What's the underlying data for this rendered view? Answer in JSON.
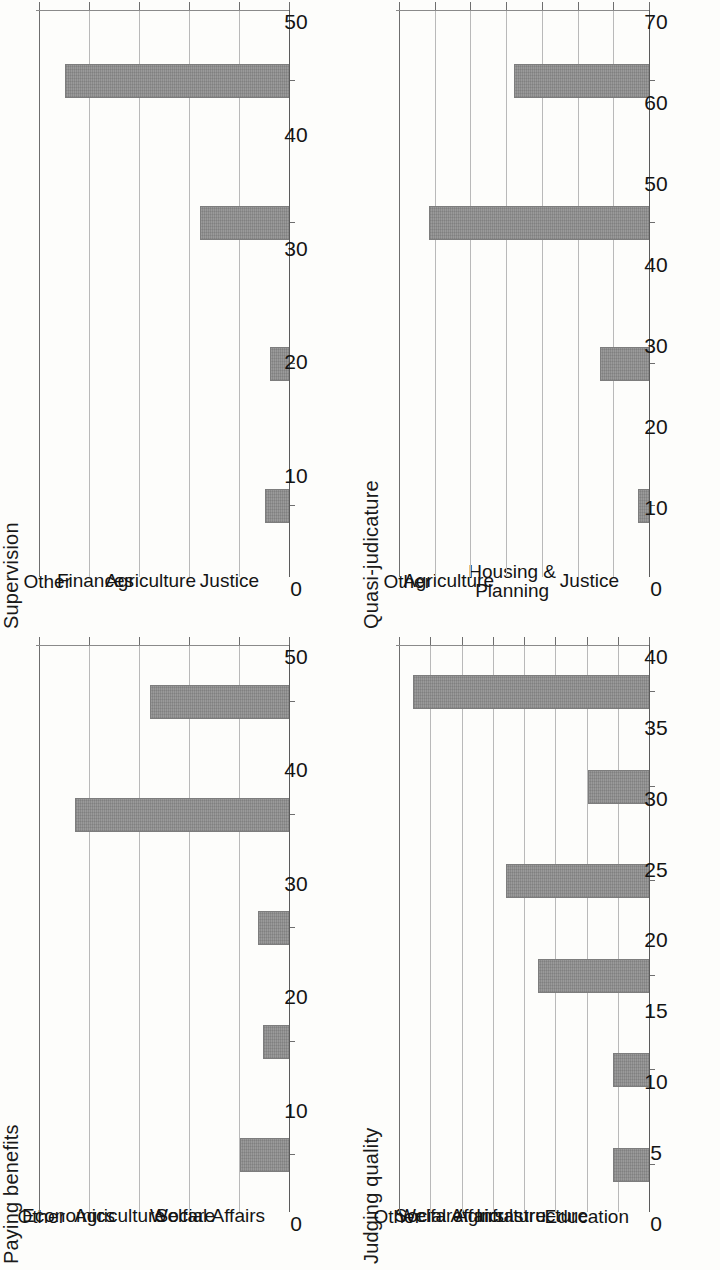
{
  "figure": {
    "layout": "2x2 grid of bar charts, page scanned rotated 90 degrees",
    "bar_color": "#9a9a9a",
    "grid_color": "#b9b9b9",
    "axis_color": "#6e6e6e"
  },
  "chart_data": [
    {
      "id": "supervision",
      "type": "bar",
      "title": "Supervision",
      "xlabel": "",
      "ylabel": "",
      "ylim": [
        0,
        50
      ],
      "yticks": [
        0,
        10,
        20,
        30,
        40,
        50
      ],
      "grid": true,
      "orientation": "vertical-rotated",
      "categories": [
        "Other",
        "Finances",
        "Agriculture",
        "Justice"
      ],
      "values": [
        5,
        4,
        18,
        45
      ]
    },
    {
      "id": "quasi-judicature",
      "type": "bar",
      "title": "Quasi-judicature",
      "xlabel": "",
      "ylabel": "",
      "ylim": [
        0,
        70
      ],
      "yticks": [
        0,
        10,
        20,
        30,
        40,
        50,
        60,
        70
      ],
      "grid": true,
      "orientation": "vertical-rotated",
      "categories": [
        "Other",
        "Agriculture",
        "Housing & Planning",
        "Justice"
      ],
      "category_lines": [
        [
          "Other"
        ],
        [
          "Agriculture"
        ],
        [
          "Housing &",
          "Planning"
        ],
        [
          "Justice"
        ]
      ],
      "values": [
        3.5,
        14,
        62,
        38
      ]
    },
    {
      "id": "paying-benefits",
      "type": "bar",
      "title": "Paying benefits",
      "xlabel": "",
      "ylabel": "",
      "ylim": [
        0,
        50
      ],
      "yticks": [
        0,
        10,
        20,
        30,
        40,
        50
      ],
      "grid": true,
      "orientation": "vertical-rotated",
      "categories": [
        "Other",
        "Economics",
        "Agriculture",
        "Welfare",
        "Social Affairs"
      ],
      "values": [
        10,
        5.5,
        6.5,
        43,
        28
      ]
    },
    {
      "id": "judging-quality",
      "type": "bar",
      "title": "Judging quality",
      "xlabel": "",
      "ylabel": "",
      "ylim": [
        0,
        40
      ],
      "yticks": [
        0,
        5,
        10,
        15,
        20,
        25,
        30,
        35,
        40
      ],
      "grid": true,
      "orientation": "vertical-rotated",
      "categories": [
        "Other",
        "Welfare",
        "Social Affairs",
        "Agriculture",
        "Infrastructure",
        "Education"
      ],
      "values": [
        6,
        6,
        18,
        23,
        10,
        38
      ]
    }
  ]
}
